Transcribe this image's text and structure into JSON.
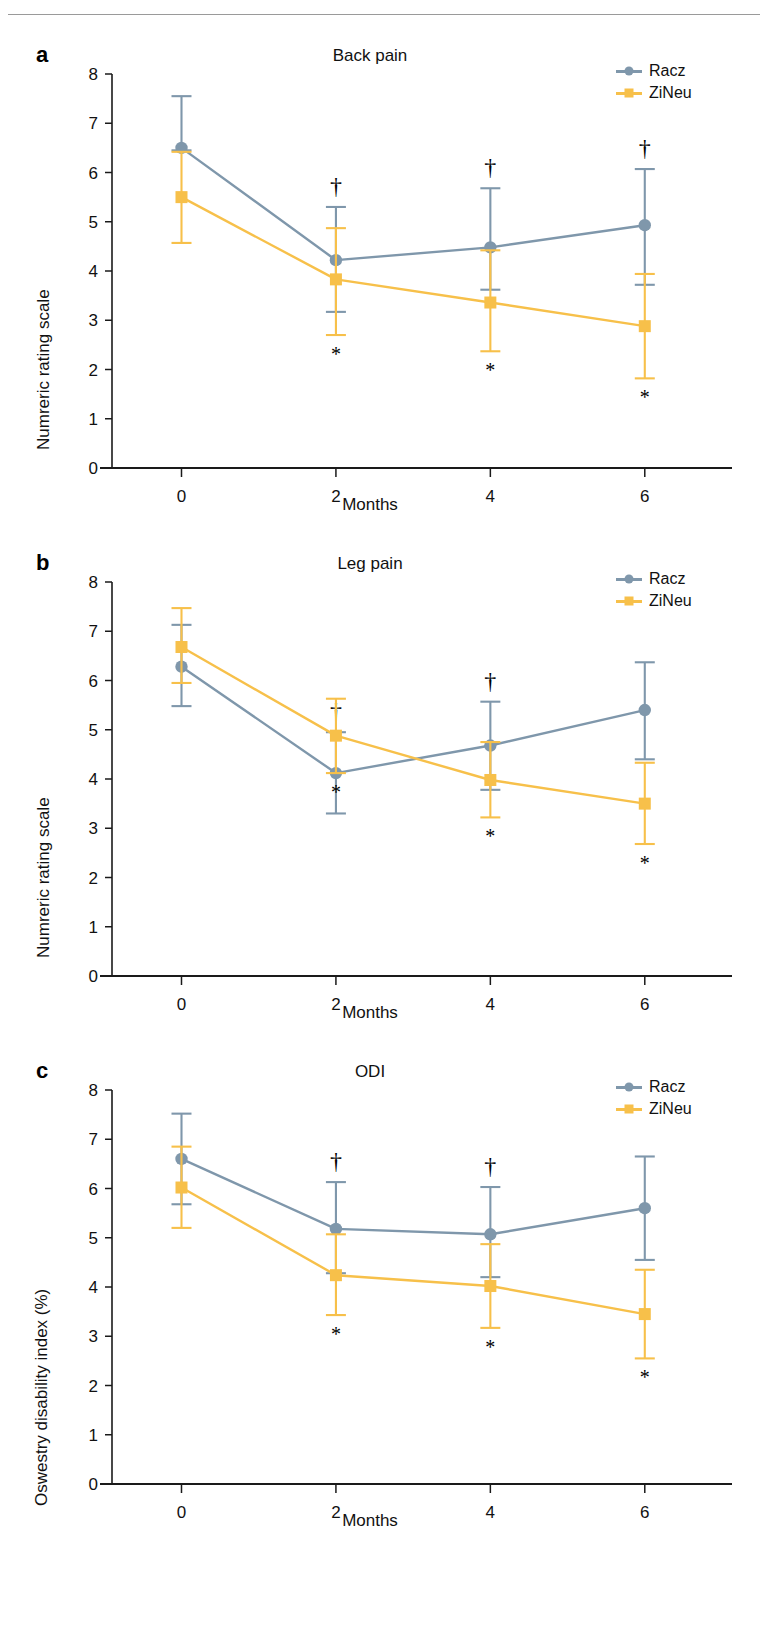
{
  "figure": {
    "header_rule": true,
    "colors": {
      "racz": "#7f97ab",
      "zineu": "#f7c04a",
      "axis": "#1a1a1a",
      "text": "#111111"
    },
    "legend": {
      "racz_label": "Racz",
      "zineu_label": "ZiNeu",
      "racz_marker": "circle-marker-icon",
      "zineu_marker": "square-marker-icon"
    },
    "annotations": {
      "dagger": "†",
      "asterisk": "*"
    }
  },
  "panels": [
    {
      "letter": "a",
      "title": "Back pain",
      "ylabel": "Numreric rating scale",
      "xlabel": "Months"
    },
    {
      "letter": "b",
      "title": "Leg pain",
      "ylabel": "Numreric rating scale",
      "xlabel": "Months"
    },
    {
      "letter": "c",
      "title": "ODI",
      "ylabel": "Oswestry disability index (%)",
      "xlabel": "Months"
    }
  ],
  "chart_data": [
    {
      "type": "line",
      "panel": "a",
      "title": "Back pain",
      "xlabel": "Months",
      "ylabel": "Numreric rating scale",
      "x": [
        0,
        2,
        4,
        6
      ],
      "xticks": [
        0,
        2,
        4,
        6
      ],
      "xlim": [
        -0.9,
        7.0
      ],
      "yticks": [
        0,
        1,
        2,
        3,
        4,
        5,
        6,
        7,
        8
      ],
      "ylim": [
        0,
        8
      ],
      "grid": false,
      "legend_position": "top-right",
      "series": [
        {
          "name": "Racz",
          "marker": "circle",
          "color": "#7f97ab",
          "values": [
            6.5,
            4.22,
            4.48,
            4.93
          ],
          "err_low": [
            6.45,
            3.17,
            3.62,
            3.72
          ],
          "err_high": [
            7.55,
            5.3,
            5.68,
            6.07
          ],
          "annotations": [
            "",
            "†",
            "†",
            "†"
          ]
        },
        {
          "name": "ZiNeu",
          "marker": "square",
          "color": "#f7c04a",
          "values": [
            5.5,
            3.83,
            3.36,
            2.88
          ],
          "err_low": [
            4.57,
            2.7,
            2.37,
            1.82
          ],
          "err_high": [
            6.42,
            4.87,
            4.42,
            3.94
          ],
          "annotations": [
            "",
            "*",
            "*",
            "*"
          ]
        }
      ]
    },
    {
      "type": "line",
      "panel": "b",
      "title": "Leg pain",
      "xlabel": "Months",
      "ylabel": "Numreric rating scale",
      "x": [
        0,
        2,
        4,
        6
      ],
      "xticks": [
        0,
        2,
        4,
        6
      ],
      "xlim": [
        -0.9,
        7.0
      ],
      "yticks": [
        0,
        1,
        2,
        3,
        4,
        5,
        6,
        7,
        8
      ],
      "ylim": [
        0,
        8
      ],
      "grid": false,
      "legend_position": "top-right",
      "series": [
        {
          "name": "Racz",
          "marker": "circle",
          "color": "#7f97ab",
          "values": [
            6.28,
            4.12,
            4.68,
            5.4
          ],
          "err_low": [
            5.48,
            3.3,
            3.78,
            4.4
          ],
          "err_high": [
            7.13,
            4.95,
            5.57,
            6.37
          ],
          "annotations": [
            "",
            "†",
            "†",
            ""
          ]
        },
        {
          "name": "ZiNeu",
          "marker": "square",
          "color": "#f7c04a",
          "values": [
            6.68,
            4.88,
            3.98,
            3.5
          ],
          "err_low": [
            5.95,
            4.12,
            3.22,
            2.68
          ],
          "err_high": [
            7.47,
            5.63,
            4.75,
            4.33
          ],
          "annotations": [
            "",
            "*",
            "*",
            "*"
          ]
        }
      ]
    },
    {
      "type": "line",
      "panel": "c",
      "title": "ODI",
      "xlabel": "Months",
      "ylabel": "Oswestry disability index (%)",
      "x": [
        0,
        2,
        4,
        6
      ],
      "xticks": [
        0,
        2,
        4,
        6
      ],
      "xlim": [
        -0.9,
        7.0
      ],
      "yticks": [
        0,
        1,
        2,
        3,
        4,
        5,
        6,
        7,
        8
      ],
      "ylim": [
        0,
        8
      ],
      "grid": false,
      "legend_position": "top-right",
      "series": [
        {
          "name": "Racz",
          "marker": "circle",
          "color": "#7f97ab",
          "values": [
            6.6,
            5.18,
            5.07,
            5.6
          ],
          "err_low": [
            5.68,
            4.28,
            4.2,
            4.55
          ],
          "err_high": [
            7.52,
            6.13,
            6.03,
            6.65
          ],
          "annotations": [
            "",
            "†",
            "†",
            ""
          ]
        },
        {
          "name": "ZiNeu",
          "marker": "square",
          "color": "#f7c04a",
          "values": [
            6.02,
            4.24,
            4.02,
            3.45
          ],
          "err_low": [
            5.2,
            3.43,
            3.17,
            2.55
          ],
          "err_high": [
            6.85,
            5.07,
            4.87,
            4.35
          ],
          "annotations": [
            "",
            "*",
            "*",
            "*"
          ]
        }
      ]
    }
  ]
}
